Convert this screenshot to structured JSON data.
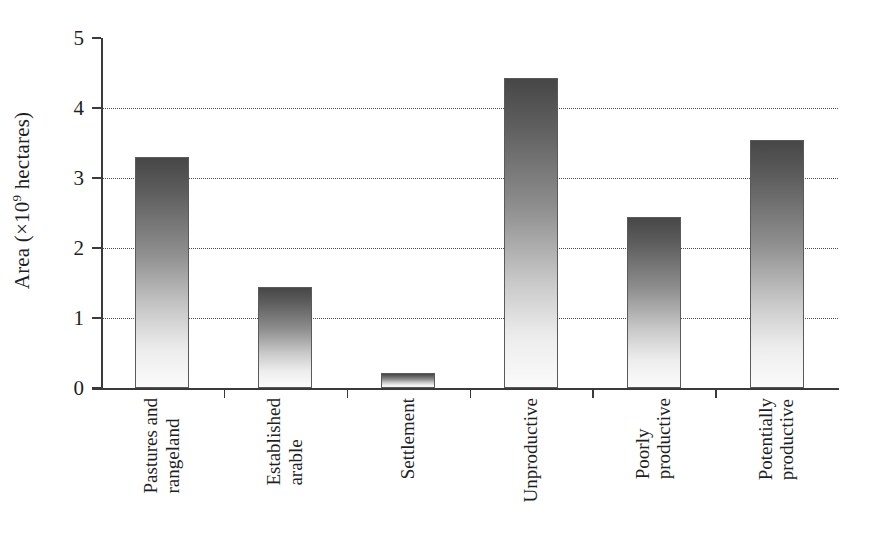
{
  "chart_data": {
    "type": "bar",
    "title": "",
    "xlabel": "",
    "ylabel": "Area (×10⁹ hectares)",
    "ylabel_parts": {
      "prefix": "Area (×10",
      "exponent": "9",
      "suffix": " hectares)"
    },
    "categories": [
      "Pastures and rangeland",
      "Established arable",
      "Settlement",
      "Unproductive",
      "Poorly productive",
      "Potentially productive"
    ],
    "category_lines": [
      [
        "Pastures and",
        "rangeland"
      ],
      [
        "Established",
        "arable"
      ],
      [
        "Settlement"
      ],
      [
        "Unproductive"
      ],
      [
        "Poorly",
        "productive"
      ],
      [
        "Potentially",
        "productive"
      ]
    ],
    "values": [
      3.3,
      1.44,
      0.21,
      4.43,
      2.45,
      3.55
    ],
    "ylim": [
      0,
      5
    ],
    "yticks": [
      0,
      1,
      2,
      3,
      4,
      5
    ],
    "ytick_labels": [
      "0",
      "1",
      "2",
      "3",
      "4",
      "5"
    ],
    "grid": "horizontal-dotted",
    "gridline_values": [
      1,
      2,
      3,
      4
    ],
    "legend": "none",
    "bar_fill": "vertical gradient dark-gray to white",
    "bar_color_top": "#474747",
    "bar_color_bottom": "#fbfbfb",
    "bar_edge_color": "#5a5a5a",
    "axis_color": "#3a3a3a",
    "background_color": "#ffffff"
  }
}
